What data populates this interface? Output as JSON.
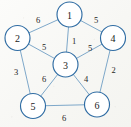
{
  "figure": {
    "background_color": "#fbfbf9",
    "node_stroke_color": "#2f6ca3",
    "node_fill_color": "#ffffff",
    "edge_color": "#6f9ec4",
    "label_color": "#1a1a1a"
  },
  "chart_data": {
    "type": "diagram",
    "subtype": "weighted-undirected-graph",
    "title": "",
    "xlabel": "",
    "ylabel": "",
    "directed": false,
    "weighted": true,
    "node_count": 6,
    "edge_count": 10,
    "nodes": [
      {
        "id": "1",
        "label": "1",
        "x": 69.5,
        "y": 14.5,
        "r": 12.5
      },
      {
        "id": "2",
        "label": "2",
        "x": 17.5,
        "y": 38.0,
        "r": 12.5
      },
      {
        "id": "3",
        "label": "3",
        "x": 65.5,
        "y": 64.5,
        "r": 12.5
      },
      {
        "id": "4",
        "label": "4",
        "x": 113.0,
        "y": 38.0,
        "r": 12.5
      },
      {
        "id": "5",
        "label": "5",
        "x": 33.0,
        "y": 106.0,
        "r": 12.5
      },
      {
        "id": "6",
        "label": "6",
        "x": 97.0,
        "y": 104.5,
        "r": 12.5
      }
    ],
    "edges": [
      {
        "source": "2",
        "target": "1",
        "weight": 6,
        "label": "6",
        "label_x": 38.0,
        "label_y": 20.0
      },
      {
        "source": "1",
        "target": "4",
        "weight": 5,
        "label": "5",
        "label_x": 96.0,
        "label_y": 20.0
      },
      {
        "source": "1",
        "target": "3",
        "weight": 1,
        "label": "1",
        "label_x": 74.0,
        "label_y": 41.0
      },
      {
        "source": "2",
        "target": "3",
        "weight": 5,
        "label": "5",
        "label_x": 44.0,
        "label_y": 46.5
      },
      {
        "source": "3",
        "target": "4",
        "weight": 5,
        "label": "5",
        "label_x": 90.0,
        "label_y": 48.0
      },
      {
        "source": "2",
        "target": "5",
        "weight": 3,
        "label": "3",
        "label_x": 16.0,
        "label_y": 72.0
      },
      {
        "source": "3",
        "target": "5",
        "weight": 6,
        "label": "6",
        "label_x": 44.0,
        "label_y": 79.0
      },
      {
        "source": "3",
        "target": "6",
        "weight": 4,
        "label": "4",
        "label_x": 86.0,
        "label_y": 79.0
      },
      {
        "source": "4",
        "target": "6",
        "weight": 2,
        "label": "2",
        "label_x": 113.5,
        "label_y": 70.0
      },
      {
        "source": "5",
        "target": "6",
        "weight": 6,
        "label": "6",
        "label_x": 64.0,
        "label_y": 118.0
      }
    ],
    "adjacency_notes": "Node 3 is the central hub connected to all other five nodes; nodes 1,2,4,5,6 form the outer pentagon ring."
  }
}
